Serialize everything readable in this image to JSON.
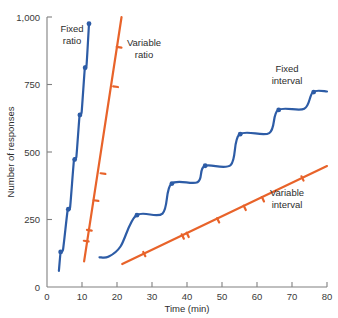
{
  "chart_data": {
    "type": "line",
    "title": "",
    "xlabel": "Time (min)",
    "ylabel": "Number of responses",
    "xlim": [
      0,
      80
    ],
    "ylim": [
      0,
      1000
    ],
    "xticks": [
      0,
      10,
      20,
      30,
      40,
      50,
      60,
      70,
      80
    ],
    "xticklabels": [
      "0",
      "10",
      "20",
      "30",
      "40",
      "50",
      "60",
      "70",
      "80"
    ],
    "yticks": [
      0,
      250,
      500,
      750,
      1000
    ],
    "yticklabels": [
      "0",
      "250",
      "500",
      "750",
      "1,000"
    ],
    "grid": false,
    "legend_position": "inline-annotations",
    "series": [
      {
        "name": "Fixed ratio",
        "color": "#2d5ca6",
        "style": "stepped-ratio",
        "label_x": 7.5,
        "label_y": 915,
        "points": [
          {
            "x": 3.4,
            "y": 60
          },
          {
            "x": 3.9,
            "y": 130
          },
          {
            "x": 4.6,
            "y": 140
          },
          {
            "x": 5.9,
            "y": 285
          },
          {
            "x": 6.6,
            "y": 295
          },
          {
            "x": 7.7,
            "y": 470
          },
          {
            "x": 8.4,
            "y": 483
          },
          {
            "x": 9.3,
            "y": 635
          },
          {
            "x": 9.9,
            "y": 648
          },
          {
            "x": 10.8,
            "y": 810
          },
          {
            "x": 11.3,
            "y": 822
          },
          {
            "x": 12.0,
            "y": 975
          }
        ],
        "markers": [
          {
            "x": 3.9,
            "y": 130
          },
          {
            "x": 6.1,
            "y": 288
          },
          {
            "x": 7.9,
            "y": 472
          },
          {
            "x": 9.4,
            "y": 637
          },
          {
            "x": 10.9,
            "y": 812
          },
          {
            "x": 12.0,
            "y": 975
          }
        ]
      },
      {
        "name": "Variable ratio",
        "color": "#e8632a",
        "style": "straight-steep",
        "label_x": 22.5,
        "label_y": 845,
        "points": [
          {
            "x": 10.6,
            "y": 95
          },
          {
            "x": 21.3,
            "y": 1000
          }
        ],
        "markers": [
          {
            "x": 11.2,
            "y": 170
          },
          {
            "x": 12.1,
            "y": 210
          },
          {
            "x": 14.0,
            "y": 320
          },
          {
            "x": 16.0,
            "y": 420
          },
          {
            "x": 19.6,
            "y": 742
          },
          {
            "x": 20.6,
            "y": 888
          }
        ]
      },
      {
        "name": "Fixed interval",
        "color": "#2d5ca6",
        "style": "scalloped-staircase",
        "label_x": 60.5,
        "label_y": 790,
        "points": [
          {
            "x": 15.0,
            "y": 110
          },
          {
            "x": 17.5,
            "y": 112
          },
          {
            "x": 21.0,
            "y": 150
          },
          {
            "x": 25.5,
            "y": 265
          },
          {
            "x": 33.0,
            "y": 272
          },
          {
            "x": 35.5,
            "y": 382
          },
          {
            "x": 43.0,
            "y": 388
          },
          {
            "x": 45.0,
            "y": 448
          },
          {
            "x": 52.5,
            "y": 452
          },
          {
            "x": 55.0,
            "y": 565
          },
          {
            "x": 63.5,
            "y": 570
          },
          {
            "x": 66.0,
            "y": 655
          },
          {
            "x": 73.5,
            "y": 660
          },
          {
            "x": 76.0,
            "y": 722
          },
          {
            "x": 80.0,
            "y": 724
          }
        ],
        "markers": [
          {
            "x": 25.7,
            "y": 266
          },
          {
            "x": 35.7,
            "y": 383
          },
          {
            "x": 45.2,
            "y": 449
          },
          {
            "x": 55.2,
            "y": 566
          },
          {
            "x": 66.2,
            "y": 656
          },
          {
            "x": 76.2,
            "y": 722
          }
        ]
      },
      {
        "name": "Variable interval",
        "color": "#e8632a",
        "style": "straight-shallow",
        "label_x": 66.0,
        "label_y": 345,
        "points": [
          {
            "x": 21.5,
            "y": 85
          },
          {
            "x": 80.0,
            "y": 448
          }
        ],
        "markers": [
          {
            "x": 27.8,
            "y": 122
          },
          {
            "x": 38.8,
            "y": 187
          },
          {
            "x": 40.2,
            "y": 193
          },
          {
            "x": 48.9,
            "y": 247
          },
          {
            "x": 56.5,
            "y": 293
          },
          {
            "x": 61.7,
            "y": 325
          },
          {
            "x": 73.0,
            "y": 402
          }
        ]
      }
    ]
  },
  "labels": {
    "fixed_ratio": "Fixed\nratio",
    "fixed_ratio_line1": "Fixed",
    "fixed_ratio_line2": "ratio",
    "variable_ratio_line1": "Variable",
    "variable_ratio_line2": "ratio",
    "fixed_interval_line1": "Fixed",
    "fixed_interval_line2": "interval",
    "variable_interval_line1": "Variable",
    "variable_interval_line2": "interval"
  },
  "colors": {
    "blue": "#2d5ca6",
    "orange": "#e8632a",
    "axis": "#808080",
    "text": "#2d2d2d",
    "background": "#ffffff"
  }
}
